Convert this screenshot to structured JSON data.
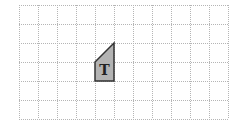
{
  "diagram": {
    "grid": {
      "columns": 11,
      "rows": 6,
      "cell_size": 19,
      "origin_x": 19,
      "origin_y": 5,
      "line_color": "#b5b5b5",
      "line_style": "dotted"
    },
    "shape": {
      "label": "T",
      "fill": "#b3b3b3",
      "stroke": "#333333",
      "points": [
        [
          95,
          62
        ],
        [
          114,
          43
        ],
        [
          114,
          81
        ],
        [
          95,
          81
        ]
      ],
      "label_x": 104.5,
      "label_y": 75
    }
  }
}
